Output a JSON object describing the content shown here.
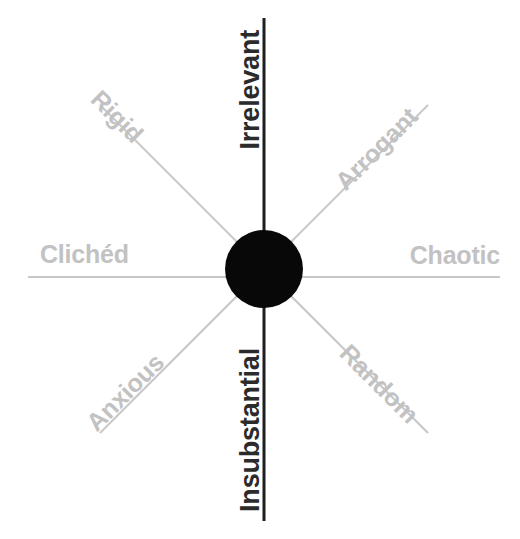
{
  "diagram": {
    "type": "radial-spoke-diagram",
    "background_color": "#ffffff",
    "hub": {
      "name": "center-hub",
      "shape": "circle",
      "color": "#080808",
      "center_x": 264,
      "center_y": 269,
      "radius": 39
    },
    "colors": {
      "major_axis": "#1f1f1f",
      "minor_axis": "#c8c8c8",
      "major_label": "#2b2b2b",
      "minor_label": "#c2c2c2",
      "hub": "#080808"
    },
    "spokes": [
      {
        "id": "irrelevant",
        "label": "Irrelevant",
        "direction": "up",
        "angle_deg": 90,
        "emphasis": "major",
        "line_color": "#1f1f1f",
        "line_width": 3,
        "text_rotation_deg": -90
      },
      {
        "id": "insubstantial",
        "label": "Insubstantial",
        "direction": "down",
        "angle_deg": 270,
        "emphasis": "major",
        "line_color": "#1f1f1f",
        "line_width": 3,
        "text_rotation_deg": -90
      },
      {
        "id": "cliched",
        "label": "Clichéd",
        "direction": "left",
        "angle_deg": 180,
        "emphasis": "minor",
        "line_color": "#c8c8c8",
        "line_width": 2,
        "text_rotation_deg": 0
      },
      {
        "id": "chaotic",
        "label": "Chaotic",
        "direction": "right",
        "angle_deg": 0,
        "emphasis": "minor",
        "line_color": "#c8c8c8",
        "line_width": 2,
        "text_rotation_deg": 0
      },
      {
        "id": "rigid",
        "label": "Rigid",
        "direction": "up-left",
        "angle_deg": 135,
        "emphasis": "minor",
        "line_color": "#c8c8c8",
        "line_width": 2,
        "text_rotation_deg": 45
      },
      {
        "id": "arrogant",
        "label": "Arrogant",
        "direction": "up-right",
        "angle_deg": 45,
        "emphasis": "minor",
        "line_color": "#c8c8c8",
        "line_width": 2,
        "text_rotation_deg": -45
      },
      {
        "id": "anxious",
        "label": "Anxious",
        "direction": "down-left",
        "angle_deg": 225,
        "emphasis": "minor",
        "line_color": "#c8c8c8",
        "line_width": 2,
        "text_rotation_deg": -45
      },
      {
        "id": "random",
        "label": "Random",
        "direction": "down-right",
        "angle_deg": 315,
        "emphasis": "minor",
        "line_color": "#c8c8c8",
        "line_width": 2,
        "text_rotation_deg": 45
      }
    ]
  }
}
